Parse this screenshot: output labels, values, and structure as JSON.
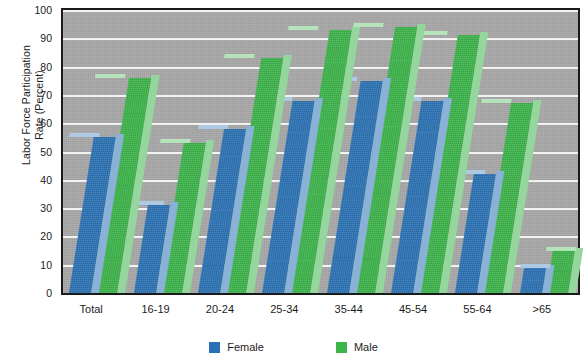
{
  "chart_data": {
    "type": "bar",
    "title": "",
    "subtitle": "",
    "xlabel": "",
    "ylabel": "Labor Force Participation Rate (Percent)",
    "ylabel_lines": [
      "Labor Force Participation",
      "Rate (Percent)"
    ],
    "categories": [
      "Total",
      "16-19",
      "20-24",
      "25-34",
      "35-44",
      "45-54",
      "55-64",
      ">65"
    ],
    "series": [
      {
        "name": "Female",
        "color": "#2a72b5",
        "values": [
          55,
          31,
          58,
          68,
          75,
          68,
          42,
          9
        ]
      },
      {
        "name": "Male",
        "color": "#3cb54a",
        "values": [
          76,
          53,
          83,
          93,
          94,
          91,
          67,
          15
        ]
      }
    ],
    "yticks": [
      0,
      10,
      20,
      30,
      40,
      50,
      60,
      70,
      80,
      90,
      100
    ],
    "ylim": [
      0,
      100
    ],
    "grid": true,
    "legend_position": "bottom",
    "plot_background": "#a8a8a8",
    "gridline_color": "#f2f2f2",
    "axis_color": "#1a1a1a"
  },
  "legend": {
    "items": [
      {
        "label": "Female",
        "color": "#2a72b5"
      },
      {
        "label": "Male",
        "color": "#3cb54a"
      }
    ]
  }
}
